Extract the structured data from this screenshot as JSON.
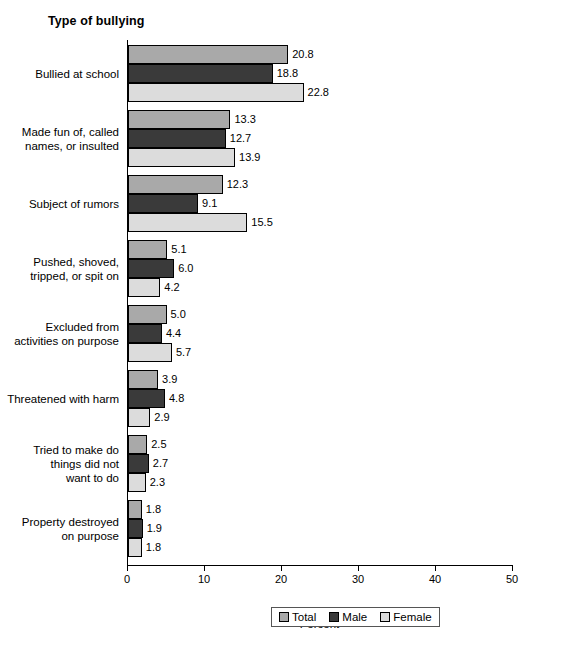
{
  "chart_data": {
    "type": "bar",
    "orientation": "horizontal",
    "title": "Type of bullying",
    "xlabel": "Percent",
    "ylabel": "",
    "xlim": [
      0,
      50
    ],
    "xticks": [
      0,
      10,
      20,
      30,
      40,
      50
    ],
    "grid": false,
    "legend_position": "bottom",
    "categories": [
      "Bullied at school",
      "Made fun of, called\nnames, or insulted",
      "Subject of rumors",
      "Pushed, shoved,\ntripped, or spit on",
      "Excluded from\nactivities on purpose",
      "Threatened with harm",
      "Tried to make do\nthings did not\nwant to do",
      "Property destroyed\non purpose"
    ],
    "series": [
      {
        "name": "Total",
        "color": "#a9a9a9",
        "values": [
          20.8,
          13.3,
          12.3,
          5.1,
          5.0,
          3.9,
          2.5,
          1.8
        ]
      },
      {
        "name": "Male",
        "color": "#3a3a3a",
        "values": [
          18.8,
          12.7,
          9.1,
          6.0,
          4.4,
          4.8,
          2.7,
          1.9
        ]
      },
      {
        "name": "Female",
        "color": "#dcdcdc",
        "values": [
          22.8,
          13.9,
          15.5,
          4.2,
          5.7,
          2.9,
          2.3,
          1.8
        ]
      }
    ]
  },
  "legend": {
    "items": [
      {
        "label": "Total"
      },
      {
        "label": "Male"
      },
      {
        "label": "Female"
      }
    ]
  }
}
